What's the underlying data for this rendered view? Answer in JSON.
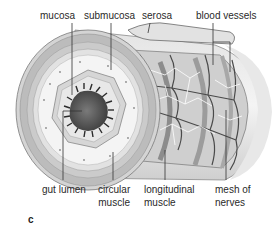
{
  "figure": {
    "panel_letter": "c",
    "labels_top": [
      {
        "text": "mucosa"
      },
      {
        "text": "submucosa"
      },
      {
        "text": "serosa"
      },
      {
        "text": "blood vessels"
      }
    ],
    "labels_bottom": [
      {
        "line1": "gut lumen",
        "line2": ""
      },
      {
        "line1": "circular",
        "line2": "muscle"
      },
      {
        "line1": "longitudinal",
        "line2": "muscle"
      },
      {
        "line1": "mesh of",
        "line2": "nerves"
      }
    ]
  },
  "colors": {
    "text": "#2a2a2a",
    "leader_line": "#333333",
    "tube_outer": "#d9d9d9",
    "muscle_layer": "#bdbdbd",
    "submucosa": "#ececec",
    "mucosa": "#cfcfcf",
    "lumen": "#5a5a5a",
    "villi": "#2b2b2b",
    "vessels": "#4a4a4a"
  }
}
